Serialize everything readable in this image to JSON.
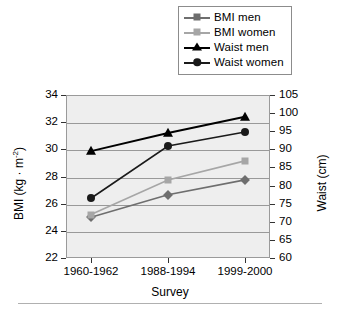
{
  "chart_data": {
    "type": "line",
    "title": "",
    "xlabel": "Survey",
    "ylabel": "BMI (kg · m-2)",
    "ylabel_right": "Waist (cm)",
    "categories": [
      "1960-1962",
      "1988-1994",
      "1999-2000"
    ],
    "grid": true,
    "legend_position": "top-right",
    "ylim": [
      22,
      34
    ],
    "yticks": [
      22,
      24,
      26,
      28,
      30,
      32,
      34
    ],
    "ylim_right": [
      60,
      105
    ],
    "yticks_right": [
      60,
      65,
      70,
      75,
      80,
      85,
      90,
      95,
      100,
      105
    ],
    "series": [
      {
        "name": "BMI men",
        "axis": "left",
        "marker": "diamond",
        "color": "#6e6e6e",
        "values": [
          25.0,
          26.65,
          27.75
        ]
      },
      {
        "name": "BMI women",
        "axis": "left",
        "marker": "square",
        "color": "#a6a6a6",
        "values": [
          25.2,
          27.75,
          29.15
        ]
      },
      {
        "name": "Waist men",
        "axis": "right",
        "marker": "triangle",
        "color": "#000000",
        "values": [
          89.5,
          94.5,
          99.0
        ]
      },
      {
        "name": "Waist women",
        "axis": "right",
        "marker": "circle",
        "color": "#1a1a1a",
        "values": [
          76.5,
          90.9,
          94.8
        ]
      }
    ]
  },
  "legend": {
    "items": [
      {
        "label": "BMI men"
      },
      {
        "label": "BMI women"
      },
      {
        "label": "Waist men"
      },
      {
        "label": "Waist women"
      }
    ]
  },
  "axes": {
    "left_ticks": [
      "34",
      "32",
      "30",
      "28",
      "26",
      "24",
      "22"
    ],
    "right_ticks": [
      "105",
      "100",
      "95",
      "90",
      "85",
      "80",
      "75",
      "70",
      "65",
      "60"
    ],
    "x_ticks": [
      "1960-1962",
      "1988-1994",
      "1999-2000"
    ],
    "left_title_main": "BMI (kg · m",
    "left_title_sup": "-2",
    "left_title_end": ")",
    "right_title": "Waist (cm)",
    "x_title": "Survey"
  }
}
